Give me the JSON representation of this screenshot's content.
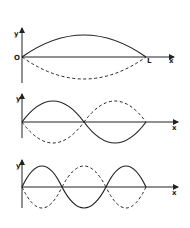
{
  "diagram": {
    "panels": [
      {
        "mode": 1,
        "y_label": "y",
        "x_label": "x",
        "origin_label": "O",
        "end_label": "L",
        "nodes": 2,
        "antinodes": 1
      },
      {
        "mode": 2,
        "y_label": "y",
        "x_label": "x",
        "nodes": 3,
        "antinodes": 2
      },
      {
        "mode": 3,
        "y_label": "y",
        "x_label": "x",
        "nodes": 4,
        "antinodes": 3
      }
    ],
    "legend": {
      "solid": "displacement at one extreme",
      "dashed": "displacement half a period later"
    },
    "colors": {
      "ink": "#222222",
      "background": "#ffffff"
    }
  }
}
